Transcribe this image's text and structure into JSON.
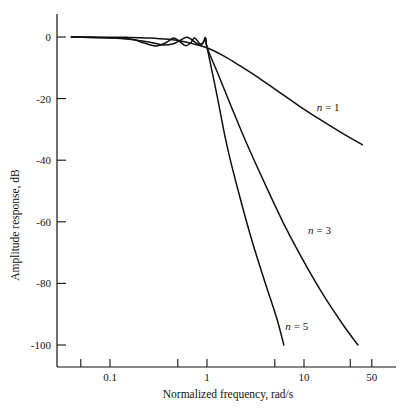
{
  "chart_data": {
    "type": "line",
    "title": "",
    "xlabel": "Normalized frequency, rad/s",
    "ylabel": "Amplitude response, dB",
    "xscale": "log",
    "xlim": [
      0.04,
      70
    ],
    "ylim": [
      -105,
      3
    ],
    "xticks": [
      0.1,
      1,
      10,
      50
    ],
    "xtick_labels": [
      "0.1",
      "1",
      "10",
      "50"
    ],
    "yticks": [
      0,
      -20,
      -40,
      -60,
      -80,
      -100
    ],
    "ytick_labels": [
      "0",
      "-20",
      "-40",
      "-60",
      "-80",
      "-100"
    ],
    "grid": false,
    "legend": "inline-annotations",
    "series": [
      {
        "name": "n = 1",
        "label": "n = 1",
        "label_x": 13.5,
        "label_y": -24,
        "points": [
          [
            0.04,
            -0.02
          ],
          [
            0.08,
            -0.05
          ],
          [
            0.15,
            -0.12
          ],
          [
            0.25,
            -0.3
          ],
          [
            0.4,
            -0.75
          ],
          [
            0.6,
            -1.6
          ],
          [
            0.8,
            -2.6
          ],
          [
            1.0,
            -3.5
          ],
          [
            1.5,
            -6.2
          ],
          [
            2.2,
            -9.4
          ],
          [
            3.5,
            -13.5
          ],
          [
            5.5,
            -17.8
          ],
          [
            9.0,
            -22.5
          ],
          [
            15.0,
            -27.0
          ],
          [
            25.0,
            -31.3
          ],
          [
            40.0,
            -35.0
          ]
        ]
      },
      {
        "name": "n = 3",
        "label": "n = 3",
        "label_x": 11.0,
        "label_y": -64,
        "points": [
          [
            0.04,
            -0.02
          ],
          [
            0.12,
            -0.3
          ],
          [
            0.25,
            -1.6
          ],
          [
            0.35,
            -2.6
          ],
          [
            0.45,
            -2.2
          ],
          [
            0.55,
            -0.8
          ],
          [
            0.62,
            -0.1
          ],
          [
            0.7,
            -0.9
          ],
          [
            0.8,
            -2.3
          ],
          [
            0.9,
            -2.0
          ],
          [
            0.97,
            -0.4
          ],
          [
            1.0,
            -3.4
          ],
          [
            1.3,
            -12.0
          ],
          [
            1.8,
            -23.0
          ],
          [
            2.6,
            -35.0
          ],
          [
            4.0,
            -48.0
          ],
          [
            6.5,
            -62.0
          ],
          [
            10.0,
            -73.0
          ],
          [
            16.0,
            -84.0
          ],
          [
            26.0,
            -94.0
          ],
          [
            36.0,
            -100.0
          ]
        ]
      },
      {
        "name": "n = 5",
        "label": "n = 5",
        "label_x": 6.4,
        "label_y": -95,
        "points": [
          [
            0.04,
            -0.02
          ],
          [
            0.15,
            -0.6
          ],
          [
            0.22,
            -1.9
          ],
          [
            0.3,
            -2.9
          ],
          [
            0.38,
            -1.8
          ],
          [
            0.45,
            -0.3
          ],
          [
            0.52,
            -1.4
          ],
          [
            0.6,
            -2.8
          ],
          [
            0.68,
            -1.9
          ],
          [
            0.74,
            -0.3
          ],
          [
            0.8,
            -1.3
          ],
          [
            0.86,
            -2.7
          ],
          [
            0.92,
            -1.7
          ],
          [
            0.96,
            -0.2
          ],
          [
            1.0,
            -3.3
          ],
          [
            1.25,
            -18.0
          ],
          [
            1.6,
            -35.0
          ],
          [
            2.1,
            -50.0
          ],
          [
            2.9,
            -66.0
          ],
          [
            4.0,
            -80.0
          ],
          [
            5.2,
            -91.0
          ],
          [
            6.2,
            -100.0
          ]
        ]
      }
    ]
  },
  "axes": {
    "y_axis_title": "Amplitude response, dB",
    "x_axis_title": "Normalized frequency, rad/s"
  }
}
